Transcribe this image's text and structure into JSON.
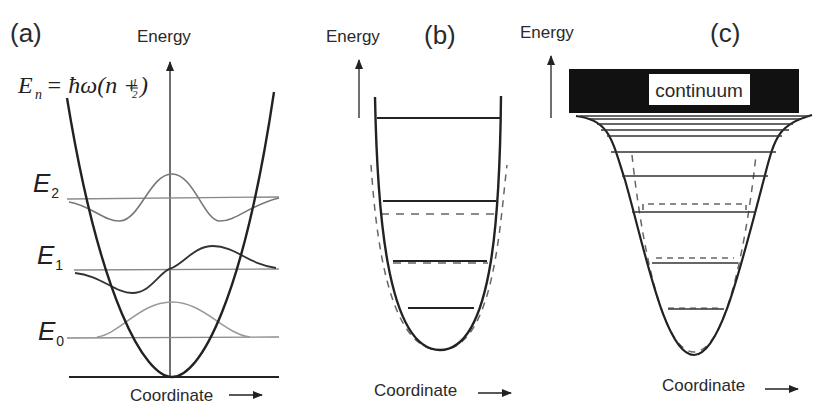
{
  "panels": {
    "a": {
      "label": "(a)",
      "y_axis_label": "Energy",
      "x_axis_label": "Coordinate",
      "equation": {
        "lhs": "E",
        "lhs_sub": "n",
        "rhs_prefix": "= ħω(n +",
        "fraction_num": "1",
        "fraction_den": "2",
        "rhs_suffix": ")"
      },
      "levels": [
        {
          "name": "E",
          "sub": "0"
        },
        {
          "name": "E",
          "sub": "1"
        },
        {
          "name": "E",
          "sub": "2"
        }
      ]
    },
    "b": {
      "label": "(b)",
      "y_axis_label": "Energy",
      "x_axis_label": "Coordinate"
    },
    "c": {
      "label": "(c)",
      "y_axis_label": "Energy",
      "x_axis_label": "Coordinate",
      "continuum_label": "continuum"
    }
  },
  "colors": {
    "ink": "#222222",
    "level_line": "#8a8a8a",
    "wave_light": "#9a9a9a",
    "wave_mid": "#777777",
    "dashed": "#666666",
    "continuum_fill": "#111111"
  }
}
